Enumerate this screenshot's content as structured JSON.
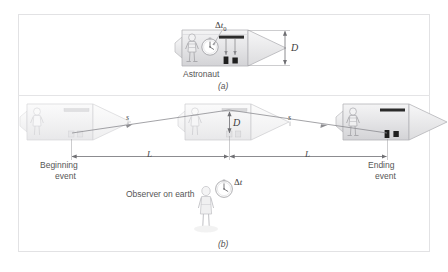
{
  "figure": {
    "panels": [
      {
        "id": "a",
        "label": "(a)",
        "caption_astronaut": "Astronaut",
        "clock_label_delta": "Δ",
        "clock_label_var": "t",
        "clock_label_sub": "0",
        "height_label": "D"
      },
      {
        "id": "b",
        "label": "(b)",
        "beginning_event_line1": "Beginning",
        "beginning_event_line2": "event",
        "ending_event_line1": "Ending",
        "ending_event_line2": "event",
        "observer_label": "Observer on earth",
        "height_label": "D",
        "slant_label_left": "s",
        "slant_label_right": "s",
        "length_label_left": "L",
        "length_label_right": "L",
        "clock_label_delta": "Δ",
        "clock_label_var": "t"
      }
    ]
  },
  "colors": {
    "frame_border": "#e2e2e4",
    "ship_body": "#ececed",
    "ship_body_faded": "#f6f6f7",
    "ship_outline": "#b9b9bc",
    "ship_outline_faded": "#dcdcde",
    "dim_line": "#6f6f73",
    "light_path": "#8c8c90",
    "text": "#555555",
    "mirror_dark": "#2b2b2b",
    "detector_dark": "#1f1f1f",
    "background": "#ffffff"
  }
}
